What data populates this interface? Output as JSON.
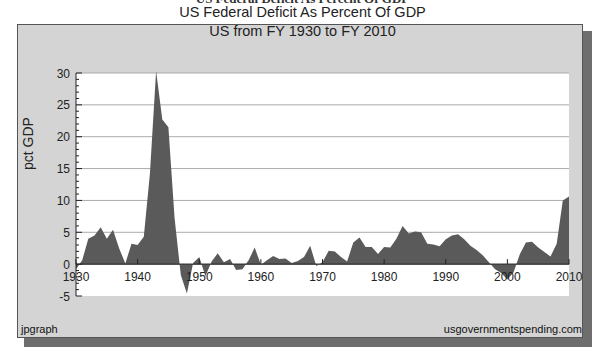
{
  "page": {
    "heading": "US Federal Deficit As Percent Of GDP"
  },
  "chart_frame": {
    "title_line1": "US Federal Deficit As Percent Of GDP",
    "title_line2": "US from FY 1930 to FY 2010",
    "footer_left": "jpgraph",
    "footer_right": "usgovernmentspending.com",
    "colors": {
      "frame_bg": "#d4d4d4",
      "plot_bg": "#ffffff",
      "area_fill": "#5a5a5a",
      "grid": "#aaaaaa",
      "shadow": "#6e6e6e"
    }
  },
  "chart_data": {
    "type": "area",
    "title": "US Federal Deficit As Percent Of GDP",
    "subtitle": "US from FY 1930 to FY 2010",
    "xlabel": "",
    "ylabel": "pct GDP",
    "xlim": [
      1930,
      2010
    ],
    "ylim": [
      -5,
      30
    ],
    "x_ticks": [
      1930,
      1940,
      1950,
      1960,
      1970,
      1980,
      1990,
      2000,
      2010
    ],
    "y_ticks": [
      -5,
      0,
      5,
      10,
      15,
      20,
      25,
      30
    ],
    "grid": true,
    "legend": null,
    "x": [
      1930,
      1931,
      1932,
      1933,
      1934,
      1935,
      1936,
      1937,
      1938,
      1939,
      1940,
      1941,
      1942,
      1943,
      1944,
      1945,
      1946,
      1947,
      1948,
      1949,
      1950,
      1951,
      1952,
      1953,
      1954,
      1955,
      1956,
      1957,
      1958,
      1959,
      1960,
      1961,
      1962,
      1963,
      1964,
      1965,
      1966,
      1967,
      1968,
      1969,
      1970,
      1971,
      1972,
      1973,
      1974,
      1975,
      1976,
      1977,
      1978,
      1979,
      1980,
      1981,
      1982,
      1983,
      1984,
      1985,
      1986,
      1987,
      1988,
      1989,
      1990,
      1991,
      1992,
      1993,
      1994,
      1995,
      1996,
      1997,
      1998,
      1999,
      2000,
      2001,
      2002,
      2003,
      2004,
      2005,
      2006,
      2007,
      2008,
      2009,
      2010
    ],
    "values": [
      -0.8,
      0.6,
      4.0,
      4.5,
      5.8,
      4.0,
      5.4,
      2.5,
      0.1,
      3.2,
      3.0,
      4.3,
      14.2,
      30.3,
      22.7,
      21.5,
      7.2,
      -1.7,
      -4.6,
      0.2,
      1.1,
      -1.9,
      0.4,
      1.7,
      0.3,
      0.8,
      -0.9,
      -0.8,
      0.6,
      2.6,
      -0.1,
      0.6,
      1.3,
      0.8,
      0.9,
      0.2,
      0.5,
      1.1,
      2.9,
      -0.3,
      0.3,
      2.1,
      2.0,
      1.1,
      0.4,
      3.4,
      4.2,
      2.7,
      2.7,
      1.6,
      2.7,
      2.6,
      4.0,
      6.0,
      4.8,
      5.1,
      5.0,
      3.2,
      3.1,
      2.8,
      3.9,
      4.5,
      4.7,
      3.9,
      2.9,
      2.2,
      1.4,
      0.3,
      -0.8,
      -1.4,
      -2.4,
      -1.3,
      1.5,
      3.4,
      3.5,
      2.6,
      1.9,
      1.2,
      3.2,
      10.0,
      10.6
    ]
  }
}
